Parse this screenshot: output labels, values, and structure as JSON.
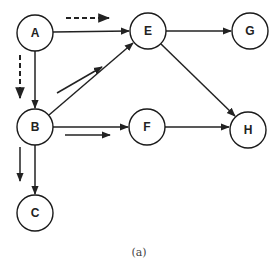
{
  "figure": {
    "caption": "(a)",
    "colors": {
      "stroke": "#222222",
      "background": "#ffffff"
    }
  },
  "nodes": [
    {
      "id": "A",
      "label": "A",
      "x": 35,
      "y": 33
    },
    {
      "id": "E",
      "label": "E",
      "x": 148,
      "y": 31
    },
    {
      "id": "G",
      "label": "G",
      "x": 250,
      "y": 31
    },
    {
      "id": "B",
      "label": "B",
      "x": 35,
      "y": 127
    },
    {
      "id": "F",
      "label": "F",
      "x": 147,
      "y": 127
    },
    {
      "id": "H",
      "label": "H",
      "x": 248,
      "y": 130
    },
    {
      "id": "C",
      "label": "C",
      "x": 35,
      "y": 213
    }
  ],
  "edges": [
    {
      "from": "A",
      "to": "E"
    },
    {
      "from": "A",
      "to": "B"
    },
    {
      "from": "B",
      "to": "E"
    },
    {
      "from": "B",
      "to": "F"
    },
    {
      "from": "B",
      "to": "C"
    },
    {
      "from": "E",
      "to": "G"
    },
    {
      "from": "E",
      "to": "H"
    },
    {
      "from": "F",
      "to": "H"
    }
  ],
  "traversal_hints": [
    {
      "along": "A-E",
      "style": "dashed"
    },
    {
      "along": "A-B",
      "style": "dashed"
    },
    {
      "along": "B-E",
      "style": "solid"
    },
    {
      "along": "B-F",
      "style": "solid"
    },
    {
      "along": "B-C",
      "style": "solid"
    }
  ]
}
